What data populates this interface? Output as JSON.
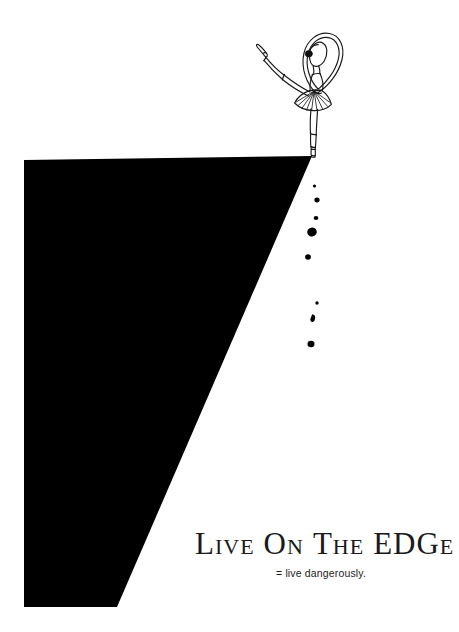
{
  "poster": {
    "width": 459,
    "height": 632,
    "background_color": "#ffffff",
    "ink_color": "#000000"
  },
  "headline": {
    "full_text": "LIVE ON THE EDGE",
    "style": "small-caps",
    "words": [
      {
        "lead": "L",
        "rest": "IVE"
      },
      {
        "lead": "O",
        "rest": "N"
      },
      {
        "lead": "T",
        "rest": "HE"
      },
      {
        "lead": "ED",
        "rest": "GE"
      }
    ],
    "w0_lead": "L",
    "w0_rest": "IVE",
    "w1_lead": "O",
    "w1_rest": "N",
    "w2_lead": "T",
    "w2_rest": "HE",
    "w3_lead": "E",
    "w3_mid": "D",
    "w3_lead2": "G",
    "w3_rest": "E"
  },
  "subtitle": {
    "text": "= live dangerously."
  },
  "illustration": {
    "cliff": {
      "name": "cliff-silhouette",
      "fill": "#000000",
      "points": "24,160 312,156 117,607 24,607"
    },
    "dancer": {
      "name": "ballerina-arabesque",
      "stroke": "#1a1a1a",
      "pose": "arabesque on pointe at cliff edge",
      "hair_bun_color": "#111111"
    },
    "falling_pebbles": [
      {
        "cx": 314.5,
        "cy": 186,
        "r": 1.6
      },
      {
        "cx": 317,
        "cy": 200,
        "r": 2.6
      },
      {
        "cx": 316,
        "cy": 218,
        "r": 2.2
      },
      {
        "cx": 312,
        "cy": 232,
        "r": 4.6
      },
      {
        "cx": 308,
        "cy": 257,
        "r": 2.9
      },
      {
        "cx": 317,
        "cy": 303,
        "r": 1.7
      },
      {
        "cx": 314,
        "cy": 318,
        "r": 3.0
      },
      {
        "cx": 311,
        "cy": 344,
        "r": 3.4
      }
    ]
  }
}
